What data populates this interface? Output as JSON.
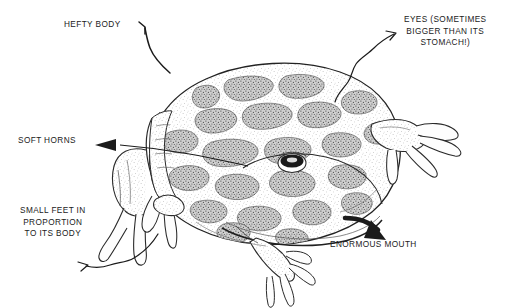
{
  "illustration": {
    "subject": "horned frog",
    "style": "pen-and-ink stipple line drawing",
    "background_color": "#ffffff",
    "ink_color": "#1b1b1b",
    "blotch_color": "#5a5a5a",
    "stipple_color": "#777777"
  },
  "labels": [
    {
      "id": "hefty-body",
      "text": "HEFTY BODY"
    },
    {
      "id": "eyes",
      "text": "EYES (SOMETIMES\nBIGGER THAN ITS\nSTOMACH!)"
    },
    {
      "id": "soft-horns",
      "text": "SOFT HORNS"
    },
    {
      "id": "small-feet",
      "text": "SMALL FEET IN\nPROPORTION\nTO ITS BODY"
    },
    {
      "id": "enormous-mouth",
      "text": "ENORMOUS MOUTH"
    }
  ]
}
